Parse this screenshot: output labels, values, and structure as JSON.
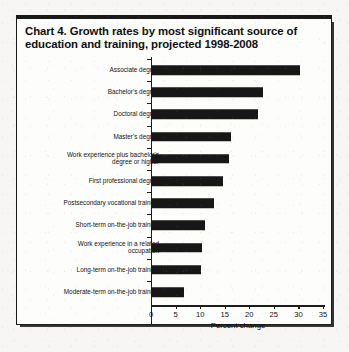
{
  "figure": {
    "title": "Chart 4. Growth rates by most significant source of education and training, projected 1998-2008"
  },
  "chart_data": {
    "type": "bar",
    "orientation": "horizontal",
    "title": "Chart 4. Growth rates by most significant source of education and training, projected 1998-2008",
    "xlabel": "Percent change",
    "ylabel": "",
    "xlim": [
      0,
      35
    ],
    "xticks": [
      0,
      5,
      10,
      15,
      20,
      25,
      30,
      35
    ],
    "xtick_labels": [
      "0",
      "5",
      "10",
      "15",
      "20",
      "25",
      "30",
      "35"
    ],
    "grid": false,
    "legend": false,
    "bar_color": "#171717",
    "categories": [
      "Associate degree",
      "Bachelor's degree",
      "Doctoral degree",
      "Master's degree",
      "Work experience plus bachelor's degree or higher",
      "First professional degree",
      "Postsecondary vocational training",
      "Short-term on-the-job training",
      "Work experience in a related occupation",
      "Long-term on-the-job training",
      "Moderate-term on-the-job training"
    ],
    "category_lines": [
      [
        "Associate degree"
      ],
      [
        "Bachelor's degree"
      ],
      [
        "Doctoral degree"
      ],
      [
        "Master's degree"
      ],
      [
        "Work experience plus bachelor's",
        "degree or higher"
      ],
      [
        "First professional degree"
      ],
      [
        "Postsecondary vocational training"
      ],
      [
        "Short-term on-the-job training"
      ],
      [
        "Work experience in a related",
        "occupation"
      ],
      [
        "Long-term on-the-job training"
      ],
      [
        "Moderate-term on-the-job training"
      ]
    ],
    "values": [
      30.3,
      22.7,
      21.7,
      16.2,
      15.8,
      14.7,
      12.9,
      10.9,
      10.4,
      10.2,
      6.8
    ]
  }
}
